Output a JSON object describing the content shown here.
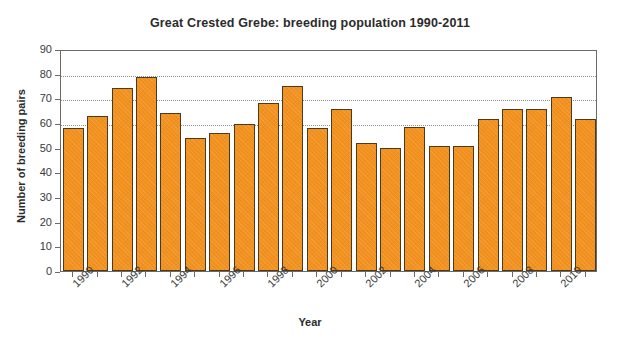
{
  "chart_data": {
    "type": "bar",
    "title": "Great Crested Grebe: breeding population 1990-2011",
    "xlabel": "Year",
    "ylabel": "Number of breeding pairs",
    "ylim": [
      0,
      90
    ],
    "ytick_step": 10,
    "yticks": [
      0,
      10,
      20,
      30,
      40,
      50,
      60,
      70,
      80,
      90
    ],
    "grid": true,
    "gridlines_at": [
      60,
      70,
      80
    ],
    "legend": null,
    "legend_position": "none",
    "xtick_label_rotation": -45,
    "xtick_labels_shown": [
      "1990",
      "1992",
      "1994",
      "1996",
      "1998",
      "2000",
      "2002",
      "2004",
      "2006",
      "2008",
      "2010"
    ],
    "bar_color": "#F2911E",
    "bar_edge_color": "#4A3A22",
    "categories": [
      "1990",
      "1991",
      "1992",
      "1993",
      "1994",
      "1995",
      "1996",
      "1997",
      "1998",
      "1999",
      "2000",
      "2001",
      "2002",
      "2003",
      "2004",
      "2005",
      "2006",
      "2007",
      "2008",
      "2009",
      "2010",
      "2011"
    ],
    "values": [
      58,
      63,
      74,
      78.5,
      64,
      54,
      56,
      59.5,
      68,
      75,
      58,
      65.5,
      52,
      50,
      58.5,
      50.5,
      50.5,
      61.5,
      65.5,
      65.5,
      70.5,
      61.5
    ]
  }
}
